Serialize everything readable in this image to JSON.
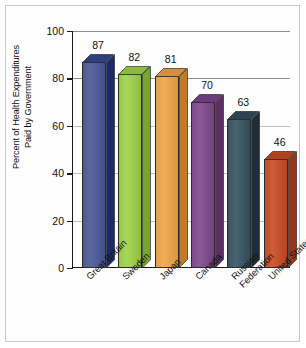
{
  "chart_data": {
    "type": "bar",
    "title": "",
    "xlabel": "",
    "ylabel": "Percent of Health Expenditures Paid by Government",
    "ylabel_line1": "Percent of Health Expenditures",
    "ylabel_line2": "Paid by Government",
    "categories": [
      "Great Britain",
      "Sweden",
      "Japan",
      "Canada",
      "Russian Federation",
      "United States"
    ],
    "values": [
      87,
      82,
      81,
      70,
      63,
      46
    ],
    "value_labels": [
      "87",
      "82",
      "81",
      "70",
      "63",
      "46"
    ],
    "ylim": [
      0,
      100
    ],
    "ytick_labels": [
      "0",
      "20",
      "40",
      "60",
      "80",
      "100"
    ],
    "ytick_values": [
      0,
      20,
      40,
      60,
      80,
      100
    ],
    "grid": true,
    "legend": "none",
    "style": "3d-bars",
    "series": [
      {
        "name": "Percent of Health Expenditures Paid by Government",
        "values": [
          87,
          82,
          81,
          70,
          63,
          46
        ]
      }
    ],
    "bar_colors": [
      {
        "front": "#4d5a93",
        "side": "#1b2a6b",
        "top": "#2f3f80"
      },
      {
        "front": "#9ac84a",
        "side": "#78a62c",
        "top": "#8cbb3c"
      },
      {
        "front": "#e2a04d",
        "side": "#c07a28",
        "top": "#d58f3d"
      },
      {
        "front": "#7d4a8a",
        "side": "#5a2f66",
        "top": "#6c3c79"
      },
      {
        "front": "#3b5563",
        "side": "#1e2d38",
        "top": "#2c4250"
      },
      {
        "front": "#c04e2a",
        "side": "#9a3618",
        "top": "#ae4220"
      }
    ],
    "axis_color": "#1a1a1a",
    "grid_color": "#8d8d8d",
    "background": "#ffffff",
    "frame_color": "#c9c9c9"
  }
}
